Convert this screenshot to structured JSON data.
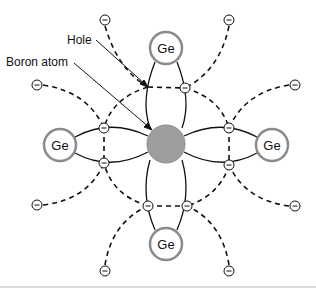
{
  "diagram": {
    "labels": {
      "hole": "Hole",
      "boron_atom": "Boron atom"
    },
    "atoms": [
      {
        "id": "ge-top",
        "label": "Ge",
        "cx": 166,
        "cy": 48
      },
      {
        "id": "ge-left",
        "label": "Ge",
        "cx": 60,
        "cy": 145
      },
      {
        "id": "ge-right",
        "label": "Ge",
        "cx": 272,
        "cy": 145
      },
      {
        "id": "ge-bottom",
        "label": "Ge",
        "cx": 166,
        "cy": 244
      }
    ],
    "center_atom": {
      "id": "boron",
      "cx": 166,
      "cy": 144,
      "r": 19,
      "color": "#9e9e9e"
    },
    "electron_symbol": "−",
    "colors": {
      "ge_ring": "#8a8a8a",
      "line": "#111111",
      "center_fill": "#9e9e9e",
      "divider": "#cccccc"
    }
  }
}
